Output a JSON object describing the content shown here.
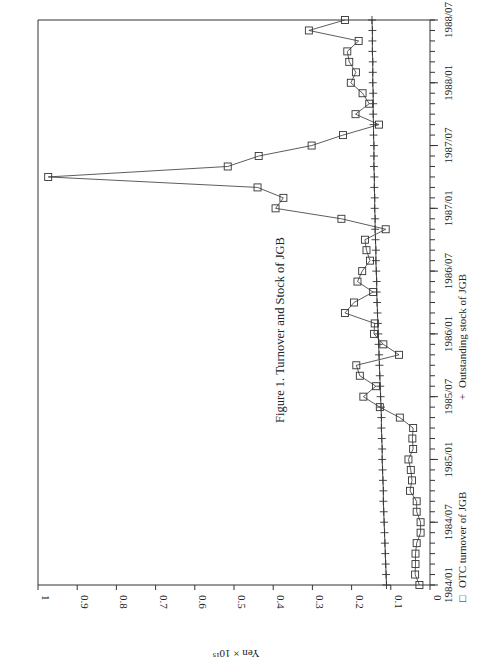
{
  "chart_data": {
    "type": "line",
    "title": "Figure 1.  Turnover and Stock of JGB",
    "xlabel": "",
    "ylabel": "Yen × 10¹⁵",
    "orientation": "rotated 90° counter-clockwise (time axis vertical on right, value axis horizontal at bottom)",
    "ylim": [
      0,
      1
    ],
    "y_ticks": [
      "0",
      "0.1",
      "0.2",
      "0.3",
      "0.4",
      "0.5",
      "0.6",
      "0.7",
      "0.8",
      "0.9",
      "1"
    ],
    "x_tick_labels": [
      "1984/01",
      "1984/07",
      "1985/01",
      "1985/07",
      "1986/01",
      "1986/07",
      "1987/01",
      "1987/07",
      "1988/01",
      "1988/07"
    ],
    "grid": false,
    "legend_position": "right (rotated), below time axis labels",
    "x": [
      "1984/01",
      "1984/02",
      "1984/03",
      "1984/04",
      "1984/05",
      "1984/06",
      "1984/07",
      "1984/08",
      "1984/09",
      "1984/10",
      "1984/11",
      "1984/12",
      "1985/01",
      "1985/02",
      "1985/03",
      "1985/04",
      "1985/05",
      "1985/06",
      "1985/07",
      "1985/08",
      "1985/09",
      "1985/10",
      "1985/11",
      "1985/12",
      "1986/01",
      "1986/02",
      "1986/03",
      "1986/04",
      "1986/05",
      "1986/06",
      "1986/07",
      "1986/08",
      "1986/09",
      "1986/10",
      "1986/11",
      "1986/12",
      "1987/01",
      "1987/02",
      "1987/03",
      "1987/04",
      "1987/05",
      "1987/06",
      "1987/07",
      "1987/08",
      "1987/09",
      "1987/10",
      "1987/11",
      "1987/12",
      "1988/01",
      "1988/02",
      "1988/03",
      "1988/04",
      "1988/05",
      "1988/06",
      "1988/07"
    ],
    "series": [
      {
        "name": "OTC turnover of JGB",
        "marker": "square",
        "values": [
          0.027,
          0.038,
          0.037,
          0.037,
          0.034,
          0.024,
          0.024,
          0.034,
          0.034,
          0.051,
          0.046,
          0.049,
          0.055,
          0.043,
          0.045,
          0.043,
          0.077,
          0.128,
          0.17,
          0.138,
          0.179,
          0.188,
          0.079,
          0.119,
          0.143,
          0.141,
          0.217,
          0.194,
          0.145,
          0.185,
          0.173,
          0.153,
          0.162,
          0.166,
          0.113,
          0.226,
          0.394,
          0.374,
          0.44,
          0.974,
          0.516,
          0.437,
          0.302,
          0.222,
          0.13,
          0.19,
          0.155,
          0.172,
          0.202,
          0.189,
          0.206,
          0.211,
          0.182,
          0.309,
          0.217
        ]
      },
      {
        "name": "Outstanding stock of JGB",
        "marker": "plus",
        "values": [
          0.111,
          0.112,
          0.113,
          0.114,
          0.115,
          0.116,
          0.117,
          0.118,
          0.119,
          0.119,
          0.12,
          0.121,
          0.122,
          0.122,
          0.123,
          0.124,
          0.124,
          0.125,
          0.126,
          0.127,
          0.128,
          0.129,
          0.13,
          0.131,
          0.132,
          0.133,
          0.134,
          0.135,
          0.136,
          0.136,
          0.137,
          0.138,
          0.138,
          0.139,
          0.14,
          0.14,
          0.141,
          0.141,
          0.142,
          0.142,
          0.143,
          0.143,
          0.143,
          0.144,
          0.144,
          0.145,
          0.145,
          0.145,
          0.146,
          0.146,
          0.146,
          0.147,
          0.147,
          0.147,
          0.148
        ]
      }
    ]
  },
  "legend": {
    "turnover_symbol": "□",
    "turnover_label": "OTC turnover of JGB",
    "stock_symbol": "+",
    "stock_label": "Outstanding stock of JGB"
  }
}
